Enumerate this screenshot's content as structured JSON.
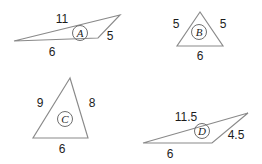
{
  "figure": {
    "background_color": "#ffffff",
    "stroke_color": "#8a8a8a",
    "text_color": "#1c1c1c",
    "badge_stroke_color": "#6f6f6f",
    "triangles": [
      {
        "id": "A",
        "badge_label": "A",
        "badge_x": 80,
        "badge_y": 33,
        "points": "14,41 120,15 98,38",
        "labels": [
          {
            "name": "side-label-a-top",
            "text": "11",
            "x": 62,
            "y": 20
          },
          {
            "name": "side-label-a-right",
            "text": "5",
            "x": 110,
            "y": 37
          },
          {
            "name": "side-label-a-bottom",
            "text": "6",
            "x": 52,
            "y": 53
          }
        ]
      },
      {
        "id": "B",
        "badge_label": "B",
        "badge_x": 199,
        "badge_y": 32,
        "points": "200,12 177,46 223,46",
        "labels": [
          {
            "name": "side-label-b-left",
            "text": "5",
            "x": 176,
            "y": 25
          },
          {
            "name": "side-label-b-right",
            "text": "5",
            "x": 223,
            "y": 25
          },
          {
            "name": "side-label-b-bottom",
            "text": "6",
            "x": 200,
            "y": 57
          }
        ]
      },
      {
        "id": "C",
        "badge_label": "C",
        "badge_x": 65,
        "badge_y": 119,
        "points": "70,78 33,138 88,138",
        "labels": [
          {
            "name": "side-label-c-left",
            "text": "9",
            "x": 40,
            "y": 104
          },
          {
            "name": "side-label-c-right",
            "text": "8",
            "x": 92,
            "y": 104
          },
          {
            "name": "side-label-c-bottom",
            "text": "6",
            "x": 62,
            "y": 150
          }
        ]
      },
      {
        "id": "D",
        "badge_label": "D",
        "badge_x": 202,
        "badge_y": 131,
        "points": "143,143 248,113 212,143",
        "labels": [
          {
            "name": "side-label-d-top",
            "text": "11.5",
            "x": 186,
            "y": 118
          },
          {
            "name": "side-label-d-right",
            "text": "4.5",
            "x": 236,
            "y": 136
          },
          {
            "name": "side-label-d-bottom",
            "text": "6",
            "x": 170,
            "y": 155
          }
        ]
      }
    ]
  }
}
